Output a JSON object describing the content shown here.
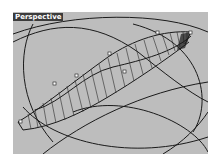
{
  "viewport": {
    "label": "Perspective",
    "background": "#bdbdbd",
    "label_background": "#3c3c3c",
    "line_color": "#1a1a1a"
  }
}
